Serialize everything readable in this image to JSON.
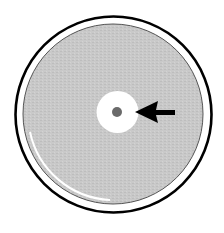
{
  "diagram": {
    "elements": {
      "dish_rim": {
        "label": "petri dish rim",
        "stroke": "#000000"
      },
      "agar_lawn": {
        "label": "bacterial lawn",
        "fill": "#c8c8c8"
      },
      "inhibition_zone": {
        "label": "zone of inhibition",
        "fill": "#ffffff"
      },
      "disk": {
        "label": "antibiotic disk",
        "fill": "#6a6a6a"
      },
      "arrow": {
        "label": "pointer arrow",
        "direction": "left",
        "fill": "#000000"
      }
    }
  }
}
